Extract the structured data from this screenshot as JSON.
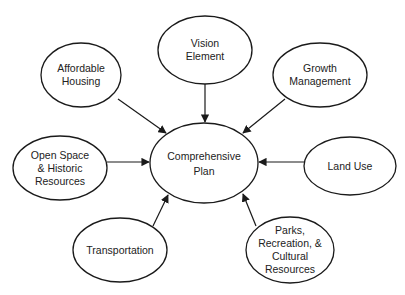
{
  "diagram": {
    "center": {
      "id": "comprehensive-plan",
      "lines": [
        "Comprehensive",
        "Plan"
      ],
      "cx": 204,
      "cy": 163,
      "rx": 54,
      "ry": 40
    },
    "nodes": [
      {
        "id": "vision-element",
        "lines": [
          "Vision",
          "Element"
        ],
        "cx": 205,
        "cy": 50,
        "rx": 47,
        "ry": 34,
        "edge": {
          "x1": 205,
          "y1": 84,
          "x2": 205,
          "y2": 122
        }
      },
      {
        "id": "affordable-housing",
        "lines": [
          "Affordable",
          "Housing"
        ],
        "cx": 81,
        "cy": 75,
        "rx": 40,
        "ry": 32,
        "edge": {
          "x1": 118,
          "y1": 99,
          "x2": 166,
          "y2": 133
        }
      },
      {
        "id": "growth-management",
        "lines": [
          "Growth",
          "Management"
        ],
        "cx": 320,
        "cy": 75,
        "rx": 47,
        "ry": 32,
        "edge": {
          "x1": 285,
          "y1": 99,
          "x2": 243,
          "y2": 133
        }
      },
      {
        "id": "open-space-historic-resources",
        "lines": [
          "Open Space",
          "& Historic",
          "Resources"
        ],
        "cx": 60,
        "cy": 168,
        "rx": 47,
        "ry": 32,
        "edge": {
          "x1": 107,
          "y1": 162,
          "x2": 149,
          "y2": 162
        }
      },
      {
        "id": "land-use",
        "lines": [
          "Land Use"
        ],
        "cx": 350,
        "cy": 166,
        "rx": 46,
        "ry": 29,
        "edge": {
          "x1": 304,
          "y1": 162,
          "x2": 259,
          "y2": 162
        }
      },
      {
        "id": "transportation",
        "lines": [
          "Transportation"
        ],
        "cx": 120,
        "cy": 250,
        "rx": 47,
        "ry": 32,
        "edge": {
          "x1": 153,
          "y1": 226,
          "x2": 168,
          "y2": 195
        }
      },
      {
        "id": "parks-recreation-cultural-resources",
        "lines": [
          "Parks,",
          "Recreation, &",
          "Cultural",
          "Resources"
        ],
        "cx": 290,
        "cy": 250,
        "rx": 44,
        "ry": 33,
        "edge": {
          "x1": 256,
          "y1": 226,
          "x2": 243,
          "y2": 194
        }
      }
    ],
    "style": {
      "stroke": "#1a1a1a",
      "fill": "#ffffff",
      "text": "#222222"
    }
  }
}
